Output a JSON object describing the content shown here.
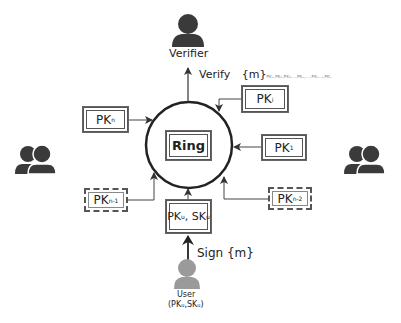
{
  "verifier": {
    "label": "Verifier",
    "icon": "person-icon"
  },
  "verify_edge": {
    "label": "Verify",
    "message": "{m}",
    "subscript": "PK₁,PK₂,PK₃...,PKᵤ,...,PKₙ₋₁,PKₙ"
  },
  "ring": {
    "label": "Ring"
  },
  "nodes": {
    "pk_i": {
      "base": "PK",
      "sub": "i",
      "style": "solid"
    },
    "pk_1": {
      "base": "PK",
      "sub": "1",
      "style": "solid"
    },
    "pk_n_minus_2": {
      "base": "PK",
      "sub": "n-2",
      "style": "dashed"
    },
    "pk_n": {
      "base": "PK",
      "sub": "n",
      "style": "solid"
    },
    "pk_n_minus_1": {
      "base": "PK",
      "sub": "n-1",
      "style": "dashed"
    },
    "pk_u_sk_u": {
      "base1": "PK",
      "sub1": "u",
      "sep": ", ",
      "base2": "SK",
      "sub2": "u",
      "style": "solid"
    }
  },
  "sign_edge": {
    "label": "Sign {m}"
  },
  "user": {
    "label": "User",
    "keys": "(PKᵤ,SKᵤ)",
    "icon": "person-icon"
  },
  "groups": {
    "left": "group-icon",
    "right": "group-icon"
  },
  "colors": {
    "dark_icon": "#3a3a3a",
    "user_icon": "#9a9a9a",
    "line": "#333333"
  }
}
